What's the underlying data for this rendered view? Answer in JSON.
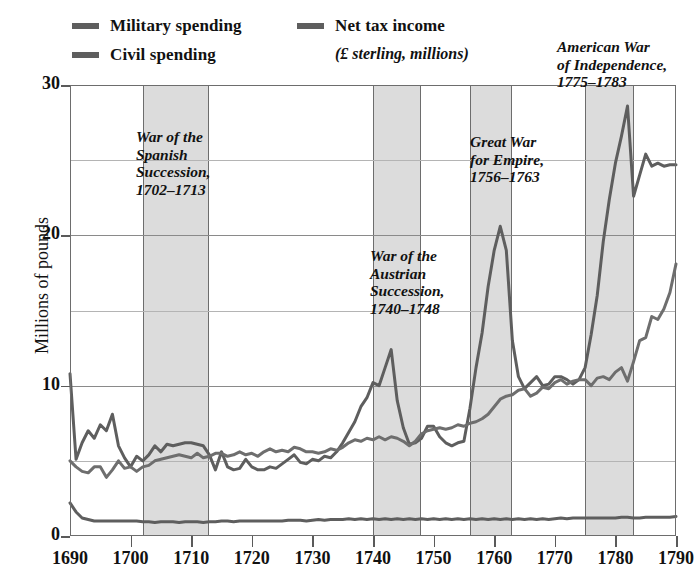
{
  "legend": {
    "entries": [
      {
        "id": "military",
        "label": "Military spending",
        "color": "#5e5e5e"
      },
      {
        "id": "civil",
        "label": "Civil spending",
        "color": "#5e5e5e"
      },
      {
        "id": "tax",
        "label": "Net tax income",
        "color": "#5e5e5e"
      }
    ],
    "tax_sublabel": "(£ sterling, millions)"
  },
  "annotations": [
    {
      "id": "spanish",
      "text": "War of the\nSpanish\nSuccession,\n1702–1713"
    },
    {
      "id": "austrian",
      "text": "War of the\nAustrian\nSuccession,\n1740–1748"
    },
    {
      "id": "empire",
      "text": "Great War\nfor Empire,\n1756–1763"
    },
    {
      "id": "american",
      "text": "American War\nof Independence,\n1775–1783"
    }
  ],
  "chart_data": {
    "type": "line",
    "title": "",
    "xlabel": "",
    "ylabel": "Millions of pounds",
    "xlim": [
      1690,
      1790
    ],
    "ylim": [
      0,
      30
    ],
    "xticks": [
      1690,
      1700,
      1710,
      1720,
      1730,
      1740,
      1750,
      1760,
      1770,
      1780,
      1790
    ],
    "yticks": [
      0,
      10,
      20,
      30
    ],
    "y_gridlines": [
      5,
      10,
      15,
      20,
      25,
      30
    ],
    "grid": true,
    "legend_position": "above-plot",
    "units": "£ sterling, millions",
    "shaded_bands": [
      {
        "label": "War of the Spanish Succession",
        "start": 1702,
        "end": 1713
      },
      {
        "label": "War of the Austrian Succession",
        "start": 1740,
        "end": 1748
      },
      {
        "label": "Great War for Empire",
        "start": 1756,
        "end": 1763
      },
      {
        "label": "American War of Independence",
        "start": 1775,
        "end": 1783
      }
    ],
    "x": [
      1690,
      1691,
      1692,
      1693,
      1694,
      1695,
      1696,
      1697,
      1698,
      1699,
      1700,
      1701,
      1702,
      1703,
      1704,
      1705,
      1706,
      1707,
      1708,
      1709,
      1710,
      1711,
      1712,
      1713,
      1714,
      1715,
      1716,
      1717,
      1718,
      1719,
      1720,
      1721,
      1722,
      1723,
      1724,
      1725,
      1726,
      1727,
      1728,
      1729,
      1730,
      1731,
      1732,
      1733,
      1734,
      1735,
      1736,
      1737,
      1738,
      1739,
      1740,
      1741,
      1742,
      1743,
      1744,
      1745,
      1746,
      1747,
      1748,
      1749,
      1750,
      1751,
      1752,
      1753,
      1754,
      1755,
      1756,
      1757,
      1758,
      1759,
      1760,
      1761,
      1762,
      1763,
      1764,
      1765,
      1766,
      1767,
      1768,
      1769,
      1770,
      1771,
      1772,
      1773,
      1774,
      1775,
      1776,
      1777,
      1778,
      1779,
      1780,
      1781,
      1782,
      1783,
      1784,
      1785,
      1786,
      1787,
      1788,
      1789,
      1790
    ],
    "series": [
      {
        "name": "Military spending",
        "color": "#5e5e5e",
        "values": [
          10.8,
          5.1,
          6.2,
          7.0,
          6.5,
          7.4,
          7.0,
          8.1,
          6.0,
          5.2,
          4.6,
          5.3,
          5.0,
          5.4,
          6.0,
          5.6,
          6.1,
          6.0,
          6.1,
          6.2,
          6.2,
          6.1,
          6.0,
          5.4,
          4.4,
          5.6,
          4.6,
          4.4,
          4.5,
          5.1,
          4.6,
          4.4,
          4.4,
          4.6,
          4.5,
          4.8,
          5.1,
          5.4,
          4.9,
          4.8,
          5.1,
          5.0,
          5.3,
          5.2,
          5.6,
          6.2,
          6.9,
          7.6,
          8.6,
          9.2,
          10.2,
          10.0,
          11.2,
          12.4,
          9.0,
          7.2,
          6.1,
          6.2,
          6.5,
          7.3,
          7.3,
          6.6,
          6.2,
          6.0,
          6.2,
          6.3,
          8.5,
          11.2,
          13.5,
          16.6,
          19.0,
          20.6,
          19.0,
          13.0,
          10.6,
          9.8,
          10.2,
          10.6,
          10.0,
          10.1,
          10.6,
          10.6,
          10.4,
          10.1,
          10.4,
          11.2,
          13.4,
          16.0,
          19.6,
          22.4,
          24.8,
          26.6,
          28.6,
          22.6,
          24.0,
          25.4,
          24.6,
          24.8,
          24.6,
          24.7,
          24.7
        ]
      },
      {
        "name": "Net tax income",
        "color": "#6e6e6e",
        "values": [
          5.0,
          4.6,
          4.3,
          4.2,
          4.6,
          4.6,
          3.9,
          4.4,
          5.0,
          4.5,
          4.6,
          4.3,
          4.6,
          4.7,
          5.0,
          5.1,
          5.2,
          5.3,
          5.4,
          5.3,
          5.2,
          5.5,
          5.2,
          5.3,
          5.5,
          5.5,
          5.3,
          5.4,
          5.6,
          5.4,
          5.5,
          5.3,
          5.6,
          5.8,
          5.6,
          5.7,
          5.6,
          5.9,
          5.8,
          5.6,
          5.6,
          5.5,
          5.6,
          5.8,
          5.7,
          5.9,
          6.2,
          6.4,
          6.3,
          6.5,
          6.4,
          6.6,
          6.4,
          6.6,
          6.5,
          6.3,
          6.0,
          6.3,
          6.8,
          7.0,
          7.1,
          7.2,
          7.1,
          7.2,
          7.4,
          7.3,
          7.5,
          7.6,
          7.8,
          8.1,
          8.6,
          9.1,
          9.3,
          9.4,
          9.7,
          9.8,
          9.3,
          9.5,
          9.9,
          9.8,
          10.2,
          10.4,
          10.1,
          10.3,
          10.4,
          10.4,
          10.0,
          10.5,
          10.6,
          10.4,
          10.9,
          11.2,
          10.3,
          11.6,
          13.0,
          13.2,
          14.6,
          14.4,
          15.1,
          16.2,
          18.1
        ]
      },
      {
        "name": "Civil spending",
        "color": "#5e5e5e",
        "values": [
          2.2,
          1.6,
          1.2,
          1.1,
          1.0,
          1.0,
          1.0,
          1.0,
          1.0,
          1.0,
          1.0,
          1.0,
          0.95,
          0.95,
          0.9,
          0.95,
          0.95,
          0.95,
          0.9,
          0.95,
          0.95,
          0.95,
          0.9,
          0.95,
          0.95,
          1.0,
          1.0,
          0.95,
          1.0,
          1.0,
          1.0,
          1.0,
          1.0,
          1.0,
          1.0,
          1.0,
          1.05,
          1.05,
          1.05,
          1.0,
          1.05,
          1.1,
          1.05,
          1.1,
          1.1,
          1.1,
          1.15,
          1.1,
          1.15,
          1.1,
          1.15,
          1.1,
          1.15,
          1.1,
          1.15,
          1.1,
          1.15,
          1.1,
          1.15,
          1.1,
          1.15,
          1.1,
          1.15,
          1.1,
          1.15,
          1.1,
          1.15,
          1.1,
          1.15,
          1.1,
          1.15,
          1.1,
          1.15,
          1.1,
          1.15,
          1.1,
          1.15,
          1.1,
          1.15,
          1.1,
          1.15,
          1.2,
          1.15,
          1.2,
          1.2,
          1.2,
          1.2,
          1.2,
          1.2,
          1.2,
          1.2,
          1.25,
          1.25,
          1.2,
          1.2,
          1.25,
          1.25,
          1.25,
          1.25,
          1.25,
          1.3
        ]
      }
    ]
  }
}
